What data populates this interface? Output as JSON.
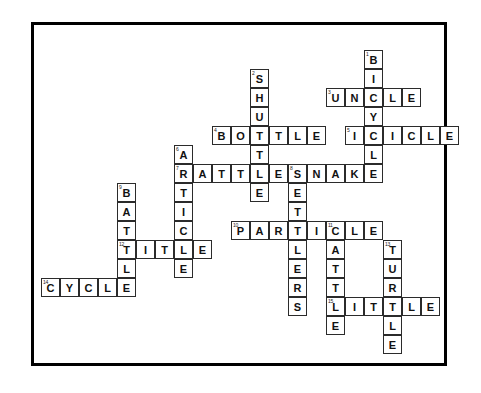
{
  "puzzle": {
    "title": "Crossword Puzzle",
    "grid": {
      "cell_size": 19,
      "origin_x": 41,
      "origin_y": 50,
      "columns": 23,
      "rows": 17,
      "border_color": "#2b2b2b",
      "cell_background": "#ffffff",
      "letter_color": "#111111",
      "number_color": "#222222"
    },
    "frame": {
      "border_color": "#000000",
      "border_width": 3,
      "background": "#ffffff"
    },
    "entries": [
      {
        "number": "1",
        "answer": "BICYCLE",
        "direction": "down",
        "col": 17,
        "row": 0,
        "length": 7
      },
      {
        "number": "2",
        "answer": "SHUTTLE",
        "direction": "down",
        "col": 11,
        "row": 1,
        "length": 7
      },
      {
        "number": "3",
        "answer": "UNCLE",
        "direction": "across",
        "col": 15,
        "row": 2,
        "length": 5
      },
      {
        "number": "4",
        "answer": "BOTTLE",
        "direction": "across",
        "col": 9,
        "row": 4,
        "length": 6
      },
      {
        "number": "5",
        "answer": "ICICLE",
        "direction": "across",
        "col": 16,
        "row": 4,
        "length": 6
      },
      {
        "number": "6",
        "answer": "ARTICLE",
        "direction": "down",
        "col": 7,
        "row": 5,
        "length": 7
      },
      {
        "number": "7",
        "answer": "RATTLESNAKE",
        "direction": "across",
        "col": 7,
        "row": 6,
        "length": 11
      },
      {
        "number": "8",
        "answer": "SETTLERS",
        "direction": "down",
        "col": 13,
        "row": 6,
        "length": 8
      },
      {
        "number": "9",
        "answer": "BATTLE",
        "direction": "down",
        "col": 4,
        "row": 7,
        "length": 6
      },
      {
        "number": "10",
        "answer": "PARTICLE",
        "direction": "across",
        "col": 10,
        "row": 9,
        "length": 8
      },
      {
        "number": "11",
        "answer": "CATTLE",
        "direction": "down",
        "col": 15,
        "row": 9,
        "length": 6
      },
      {
        "number": "12",
        "answer": "TITLE",
        "direction": "across",
        "col": 4,
        "row": 10,
        "length": 5
      },
      {
        "number": "13",
        "answer": "TURTLE",
        "direction": "down",
        "col": 18,
        "row": 10,
        "length": 6
      },
      {
        "number": "14",
        "answer": "CYCLE",
        "direction": "across",
        "col": 0,
        "row": 12,
        "length": 5
      },
      {
        "number": "15",
        "answer": "LITTLE",
        "direction": "across",
        "col": 15,
        "row": 13,
        "length": 6
      }
    ]
  }
}
